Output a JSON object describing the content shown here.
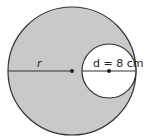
{
  "diagram": {
    "type": "geometry-circle-with-inner-circle",
    "outer_circle": {
      "fill": "#c9c9c9",
      "stroke": "#333333",
      "radius_label": "r"
    },
    "inner_circle": {
      "fill": "#ffffff",
      "stroke": "#333333",
      "diameter_label": "d = 8 cm"
    },
    "colors": {
      "shaded": "#c9c9c9",
      "line": "#333333",
      "background": "#ffffff"
    }
  }
}
